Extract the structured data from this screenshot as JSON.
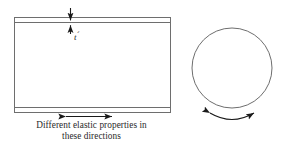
{
  "figure": {
    "background_color": "#ffffff",
    "line_color": "#6e6e6e",
    "arrow_color": "#1a1a1a",
    "text_color": "#2b2b2b",
    "caption": {
      "line1": "Different elastic properties in",
      "line2": "these directions"
    },
    "labels": {
      "thickness_symbol": "t",
      "thickness_prime": "´"
    },
    "shapes": {
      "plate_rect": {
        "name": "laminate-plate-side-view",
        "x": 14,
        "y": 17,
        "width": 157,
        "height": 96
      },
      "plate_top_band": {
        "name": "top-ply-band",
        "y_top": 17,
        "y_bottom": 23
      },
      "plate_bottom_band": {
        "name": "bottom-ply-band",
        "y_top": 107,
        "y_bottom": 113
      },
      "circle": {
        "name": "plate-cross-section-circle",
        "cx": 232,
        "cy": 68,
        "r": 40
      }
    },
    "annotations": {
      "thickness_dimension": {
        "name": "thickness-dimension-arrows",
        "x": 70,
        "y_from": 8,
        "y_to": 32
      },
      "horizontal_direction_arrow": {
        "name": "in-plane-direction-arrow",
        "x_from": 65,
        "x_to": 113,
        "y": 116
      },
      "curved_direction_arrow": {
        "name": "circumferential-direction-arrow",
        "x_from": 208,
        "x_to": 256,
        "y": 115
      }
    }
  }
}
